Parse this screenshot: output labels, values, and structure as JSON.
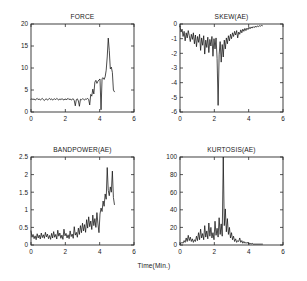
{
  "figure": {
    "background": "#ffffff",
    "line_color": "#111111",
    "axis_color": "#2b2b2b",
    "shared_xlabel": "Time(Min.)"
  },
  "chart_data": [
    {
      "type": "line",
      "name": "force",
      "title": "FORCE",
      "xlabel": "Time(Min.)",
      "ylabel": "",
      "xlim": [
        0,
        6
      ],
      "ylim": [
        0,
        20
      ],
      "grid": false,
      "legend": null,
      "xticks": [
        0,
        2,
        4,
        6
      ],
      "xticklabels": [
        "0",
        "2",
        "4",
        "6"
      ],
      "yticks": [
        0,
        5,
        10,
        15,
        20
      ],
      "yticklabels": [
        "0",
        "5",
        "10",
        "15",
        "20"
      ],
      "x": [
        0.0,
        0.06,
        0.12,
        0.18,
        0.24,
        0.3,
        0.36,
        0.42,
        0.48,
        0.54,
        0.6,
        0.66,
        0.72,
        0.78,
        0.84,
        0.9,
        0.96,
        1.02,
        1.08,
        1.14,
        1.2,
        1.26,
        1.32,
        1.38,
        1.44,
        1.5,
        1.56,
        1.62,
        1.68,
        1.74,
        1.8,
        1.86,
        1.92,
        1.98,
        2.04,
        2.1,
        2.16,
        2.22,
        2.28,
        2.34,
        2.4,
        2.46,
        2.52,
        2.58,
        2.64,
        2.7,
        2.76,
        2.82,
        2.88,
        2.94,
        3.0,
        3.06,
        3.12,
        3.18,
        3.24,
        3.3,
        3.36,
        3.42,
        3.48,
        3.54,
        3.6,
        3.66,
        3.72,
        3.78,
        3.84,
        3.9,
        3.96,
        4.02,
        4.08,
        4.14,
        4.2,
        4.26,
        4.32,
        4.38,
        4.44,
        4.5,
        4.56,
        4.62,
        4.68,
        4.74,
        4.8,
        4.86
      ],
      "values": [
        2.9,
        3.0,
        2.8,
        3.0,
        2.7,
        2.9,
        3.1,
        2.8,
        3.0,
        2.7,
        2.9,
        3.1,
        2.8,
        2.6,
        2.9,
        3.0,
        2.7,
        2.9,
        3.1,
        2.8,
        3.0,
        2.7,
        2.9,
        3.0,
        2.8,
        3.1,
        2.9,
        2.7,
        3.0,
        2.8,
        3.0,
        2.9,
        2.7,
        3.0,
        2.8,
        2.9,
        3.1,
        2.8,
        3.0,
        2.7,
        2.9,
        3.0,
        2.6,
        1.4,
        2.8,
        3.0,
        2.5,
        1.3,
        2.9,
        2.8,
        3.0,
        2.9,
        2.7,
        3.0,
        2.9,
        3.1,
        2.8,
        1.6,
        4.0,
        3.6,
        5.2,
        4.1,
        6.8,
        7.2,
        6.5,
        7.0,
        7.3,
        7.5,
        0.5,
        7.6,
        7.8,
        7.4,
        8.0,
        9.5,
        12.5,
        16.8,
        14.0,
        9.8,
        10.2,
        9.0,
        5.0,
        4.6
      ]
    },
    {
      "type": "line",
      "name": "skew",
      "title": "SKEW(AE)",
      "xlabel": "Time(Min.)",
      "ylabel": "",
      "xlim": [
        0,
        6
      ],
      "ylim": [
        -6,
        0
      ],
      "grid": false,
      "legend": null,
      "xticks": [
        0,
        2,
        4,
        6
      ],
      "xticklabels": [
        "0",
        "2",
        "4",
        "6"
      ],
      "yticks": [
        -6,
        -5,
        -4,
        -3,
        -2,
        -1,
        0
      ],
      "yticklabels": [
        "-6",
        "-5",
        "-4",
        "-3",
        "-2",
        "-1",
        "0"
      ],
      "x": [
        0.0,
        0.06,
        0.12,
        0.18,
        0.24,
        0.3,
        0.36,
        0.42,
        0.48,
        0.54,
        0.6,
        0.66,
        0.72,
        0.78,
        0.84,
        0.9,
        0.96,
        1.02,
        1.08,
        1.14,
        1.2,
        1.26,
        1.32,
        1.38,
        1.44,
        1.5,
        1.56,
        1.62,
        1.68,
        1.74,
        1.8,
        1.86,
        1.92,
        1.98,
        2.04,
        2.1,
        2.16,
        2.22,
        2.28,
        2.34,
        2.4,
        2.46,
        2.52,
        2.58,
        2.64,
        2.7,
        2.76,
        2.82,
        2.88,
        2.94,
        3.0,
        3.06,
        3.12,
        3.18,
        3.24,
        3.3,
        3.36,
        3.42,
        3.48,
        3.54,
        3.6,
        3.66,
        3.72,
        3.78,
        3.84,
        3.9,
        3.96,
        4.02,
        4.08,
        4.14,
        4.2,
        4.26,
        4.32,
        4.38,
        4.44,
        4.5,
        4.56,
        4.62,
        4.68,
        4.74,
        4.8
      ],
      "values": [
        -0.15,
        -0.55,
        -0.35,
        -0.85,
        -0.5,
        -1.15,
        -0.6,
        -0.95,
        -0.45,
        -0.8,
        -1.2,
        -0.7,
        -1.05,
        -0.6,
        -1.35,
        -0.75,
        -1.55,
        -0.85,
        -1.25,
        -0.7,
        -1.8,
        -0.95,
        -1.45,
        -0.8,
        -2.05,
        -1.1,
        -1.6,
        -0.9,
        -1.95,
        -1.05,
        -1.5,
        -0.85,
        -2.2,
        -1.0,
        -1.7,
        -0.95,
        -2.35,
        -5.55,
        -2.1,
        -1.2,
        -2.6,
        -1.4,
        -2.25,
        -1.1,
        -1.7,
        -0.95,
        -1.35,
        -0.8,
        -1.15,
        -0.7,
        -1.0,
        -0.6,
        -0.85,
        -0.5,
        -0.75,
        -0.45,
        -0.95,
        -0.55,
        -0.7,
        -0.4,
        -0.6,
        -0.35,
        -0.5,
        -0.3,
        -0.45,
        -0.28,
        -0.38,
        -0.22,
        -0.33,
        -0.2,
        -0.28,
        -0.18,
        -0.25,
        -0.15,
        -0.22,
        -0.13,
        -0.18,
        -0.12,
        -0.15,
        -0.1,
        -0.12
      ]
    },
    {
      "type": "line",
      "name": "bandpower",
      "title": "BANDPOWER(AE)",
      "xlabel": "Time(Min.)",
      "ylabel": "",
      "xlim": [
        0,
        6
      ],
      "ylim": [
        0,
        2.5
      ],
      "grid": false,
      "legend": null,
      "xticks": [
        0,
        2,
        4,
        6
      ],
      "xticklabels": [
        "0",
        "2",
        "4",
        "6"
      ],
      "yticks": [
        0,
        0.5,
        1,
        1.5,
        2,
        2.5
      ],
      "yticklabels": [
        "0",
        "0.5",
        "1",
        "1.5",
        "2",
        "2.5"
      ],
      "x": [
        0.0,
        0.06,
        0.12,
        0.18,
        0.24,
        0.3,
        0.36,
        0.42,
        0.48,
        0.54,
        0.6,
        0.66,
        0.72,
        0.78,
        0.84,
        0.9,
        0.96,
        1.02,
        1.08,
        1.14,
        1.2,
        1.26,
        1.32,
        1.38,
        1.44,
        1.5,
        1.56,
        1.62,
        1.68,
        1.74,
        1.8,
        1.86,
        1.92,
        1.98,
        2.04,
        2.1,
        2.16,
        2.22,
        2.28,
        2.34,
        2.4,
        2.46,
        2.52,
        2.58,
        2.64,
        2.7,
        2.76,
        2.82,
        2.88,
        2.94,
        3.0,
        3.06,
        3.12,
        3.18,
        3.24,
        3.3,
        3.36,
        3.42,
        3.48,
        3.54,
        3.6,
        3.66,
        3.72,
        3.78,
        3.84,
        3.9,
        3.96,
        4.02,
        4.08,
        4.14,
        4.2,
        4.26,
        4.32,
        4.38,
        4.44,
        4.5,
        4.56,
        4.62,
        4.68,
        4.74,
        4.8,
        4.86
      ],
      "values": [
        0.4,
        0.22,
        0.3,
        0.18,
        0.26,
        0.15,
        0.32,
        0.2,
        0.28,
        0.17,
        0.34,
        0.21,
        0.29,
        0.19,
        0.36,
        0.23,
        0.31,
        0.18,
        0.27,
        0.16,
        0.33,
        0.2,
        0.38,
        0.22,
        0.3,
        0.17,
        0.42,
        0.25,
        0.34,
        0.19,
        0.28,
        0.16,
        0.45,
        0.26,
        0.33,
        0.2,
        0.29,
        0.18,
        0.4,
        0.24,
        0.31,
        0.19,
        0.52,
        0.28,
        0.36,
        0.22,
        0.48,
        0.3,
        0.55,
        0.35,
        0.62,
        0.4,
        0.58,
        0.36,
        0.72,
        0.48,
        0.8,
        0.52,
        0.68,
        0.44,
        0.85,
        0.55,
        0.75,
        0.5,
        0.92,
        0.6,
        0.35,
        0.88,
        1.05,
        0.95,
        1.25,
        1.1,
        1.45,
        1.3,
        2.2,
        1.55,
        1.4,
        1.65,
        1.5,
        2.1,
        1.35,
        1.15
      ]
    },
    {
      "type": "line",
      "name": "kurtosis",
      "title": "KURTOSIS(AE)",
      "xlabel": "Time(Min.)",
      "ylabel": "",
      "xlim": [
        0,
        6
      ],
      "ylim": [
        0,
        100
      ],
      "grid": false,
      "legend": null,
      "xticks": [
        0,
        2,
        4,
        6
      ],
      "xticklabels": [
        "0",
        "2",
        "4",
        "6"
      ],
      "yticks": [
        0,
        20,
        40,
        60,
        80,
        100
      ],
      "yticklabels": [
        "0",
        "20",
        "40",
        "60",
        "80",
        "100"
      ],
      "x": [
        0.0,
        0.06,
        0.12,
        0.18,
        0.24,
        0.3,
        0.36,
        0.42,
        0.48,
        0.54,
        0.6,
        0.66,
        0.72,
        0.78,
        0.84,
        0.9,
        0.96,
        1.02,
        1.08,
        1.14,
        1.2,
        1.26,
        1.32,
        1.38,
        1.44,
        1.5,
        1.56,
        1.62,
        1.68,
        1.74,
        1.8,
        1.86,
        1.92,
        1.98,
        2.04,
        2.1,
        2.16,
        2.22,
        2.28,
        2.34,
        2.4,
        2.46,
        2.52,
        2.58,
        2.64,
        2.7,
        2.76,
        2.82,
        2.88,
        2.94,
        3.0,
        3.06,
        3.12,
        3.18,
        3.24,
        3.3,
        3.36,
        3.42,
        3.48,
        3.54,
        3.6,
        3.66,
        3.72,
        3.78,
        3.84,
        3.9,
        3.96,
        4.02,
        4.08,
        4.14,
        4.2,
        4.26,
        4.32,
        4.38,
        4.44,
        4.5,
        4.56,
        4.62,
        4.68,
        4.74,
        4.8
      ],
      "values": [
        1,
        2,
        3,
        2,
        5,
        3,
        8,
        4,
        11,
        5,
        9,
        4,
        7,
        3,
        6,
        4,
        10,
        5,
        14,
        6,
        18,
        8,
        13,
        6,
        22,
        9,
        16,
        7,
        25,
        10,
        20,
        8,
        14,
        6,
        27,
        11,
        19,
        9,
        31,
        12,
        24,
        10,
        100,
        22,
        41,
        15,
        30,
        12,
        20,
        8,
        14,
        6,
        10,
        4,
        7,
        3,
        5,
        4,
        8,
        3,
        5,
        2,
        4,
        2,
        3,
        2,
        3,
        1,
        2,
        1,
        2,
        1,
        1,
        1,
        1,
        1,
        1,
        1,
        1,
        1,
        1
      ]
    }
  ]
}
